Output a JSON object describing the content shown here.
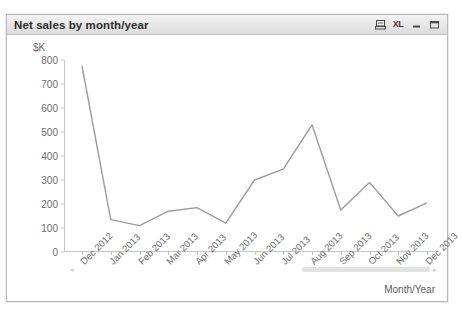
{
  "window": {
    "title": "Net sales by month/year",
    "icons": [
      {
        "name": "export-print-icon",
        "label": ""
      },
      {
        "name": "excel-export-icon",
        "label": "XL"
      },
      {
        "name": "minimize-icon",
        "label": ""
      },
      {
        "name": "maximize-icon",
        "label": ""
      }
    ]
  },
  "scrollbar": {
    "left_arrow": "◂",
    "right_arrow": "▸"
  },
  "chart_data": {
    "type": "line",
    "title": "Net sales by month/year",
    "xlabel": "Month/Year",
    "ylabel": "$K",
    "ylim": [
      0,
      800
    ],
    "yticks": [
      800,
      700,
      600,
      500,
      400,
      300,
      200,
      100,
      0
    ],
    "grid": false,
    "legend": "none",
    "line_color": "#9c9c9c",
    "categories": [
      "Dec 2012",
      "Jan 2013",
      "Feb 2013",
      "Mar 2013",
      "Apr 2013",
      "May 2013",
      "Jun 2013",
      "Jul 2013",
      "Aug 2013",
      "Sep 2013",
      "Oct 2013",
      "Nov 2013",
      "Dec 2013"
    ],
    "values": [
      775,
      135,
      110,
      170,
      185,
      120,
      300,
      345,
      530,
      175,
      290,
      150,
      205
    ]
  }
}
